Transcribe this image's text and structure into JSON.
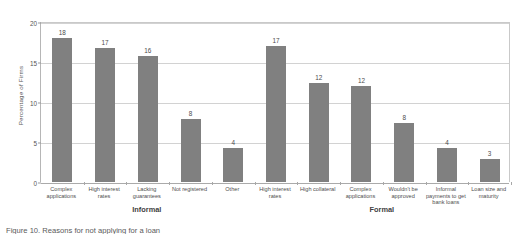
{
  "chart_data": {
    "type": "bar",
    "title": "",
    "xlabel": "",
    "ylabel": "Percentage of Firms",
    "ylim": [
      0,
      20
    ],
    "yticks": [
      0,
      5,
      10,
      15,
      20
    ],
    "grid": true,
    "legend": "none",
    "bar_color": "#808080",
    "groups": [
      {
        "name": "Informal",
        "categories": [
          "Complex applications",
          "High interest rates",
          "Lacking guarantees",
          "Not registered",
          "Other"
        ],
        "values": [
          18,
          17,
          16,
          8,
          4
        ],
        "bar_heights": [
          18,
          16.7,
          15.8,
          7.9,
          4.3
        ]
      },
      {
        "name": "Formal",
        "categories": [
          "High interest rates",
          "High collateral",
          "Complex applications",
          "Wouldn't be approved",
          "Informal payments to get bank loans",
          "Loan size and maturity"
        ],
        "values": [
          17,
          12,
          12,
          8,
          4,
          3
        ],
        "bar_heights": [
          17,
          12.4,
          12.0,
          7.4,
          4.3,
          2.9
        ]
      }
    ]
  },
  "caption": {
    "text": "Figure 10. Reasons for not applying for a loan"
  }
}
